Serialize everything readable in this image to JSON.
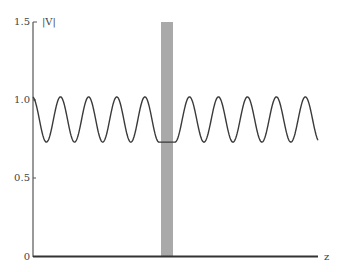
{
  "chart_data": {
    "type": "line",
    "title": "",
    "xlabel": "z",
    "ylabel": "|V|",
    "ylim": [
      0,
      1.5
    ],
    "yticks": [
      "0",
      "0.5",
      "1.0",
      "1.5"
    ],
    "xticks": [],
    "grid": false,
    "legend": null,
    "series": [
      {
        "name": "|V| standing wave magnitude",
        "description": "Sinusoidal standing-wave pattern oscillating between ~0.73 (min) and ~1.02 (max); 5 oscillation periods to the left of the shaded region and 5 to the right; flat at the minimum (~0.73) across the shaded region",
        "max": 1.02,
        "min": 0.73,
        "periods_left": 5,
        "periods_right": 5,
        "flat_value_in_shaded_region": 0.73
      }
    ],
    "annotations": [
      {
        "type": "shaded_band",
        "description": "Vertical gray shaded band (e.g. a lumped element / discontinuity location) near the middle of the z axis",
        "color": "#a9a9a9"
      }
    ]
  },
  "axes": {
    "y_label": "|V|",
    "x_label": "z",
    "y_tick_labels": [
      "1.5",
      "1.0",
      "0.5",
      "0"
    ]
  },
  "colors": {
    "curve": "#3a3a3a",
    "axis": "#555555",
    "band": "#a9a9a9",
    "baseline": "#333333"
  }
}
